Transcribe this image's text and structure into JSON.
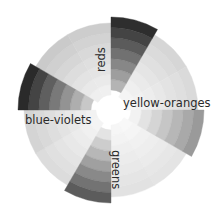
{
  "diagram": {
    "type": "color-wheel",
    "center": [
      111,
      110
    ],
    "inner_radius": 15,
    "outer_radius": 87,
    "highlight_outer_radius": 93,
    "band_count": 7,
    "segment_count": 12,
    "segment_start_angle_deg": -90,
    "segment_span_deg": 30,
    "segments": [
      {
        "index": 0,
        "highlighted": true,
        "name": "reds",
        "outer_gray": "#2e2e2e",
        "inner_gray": "#b4b4b4"
      },
      {
        "index": 1,
        "highlighted": false,
        "outer_gray": "#d6d6d6",
        "inner_gray": "#f4f4f4"
      },
      {
        "index": 2,
        "highlighted": false,
        "outer_gray": "#dadada",
        "inner_gray": "#f6f6f6"
      },
      {
        "index": 3,
        "highlighted": true,
        "name": "yellow-oranges",
        "outer_gray": "#9a9a9a",
        "inner_gray": "#f2f2f2"
      },
      {
        "index": 4,
        "highlighted": false,
        "outer_gray": "#e4e4e4",
        "inner_gray": "#f8f8f8"
      },
      {
        "index": 5,
        "highlighted": false,
        "outer_gray": "#e2e2e2",
        "inner_gray": "#f6f6f6"
      },
      {
        "index": 6,
        "highlighted": true,
        "name": "greens",
        "outer_gray": "#5c5c5c",
        "inner_gray": "#e4e4e4"
      },
      {
        "index": 7,
        "highlighted": false,
        "outer_gray": "#dcdcdc",
        "inner_gray": "#f4f4f4"
      },
      {
        "index": 8,
        "highlighted": false,
        "outer_gray": "#d4d4d4",
        "inner_gray": "#f2f2f2"
      },
      {
        "index": 9,
        "highlighted": true,
        "name": "blue-violets",
        "outer_gray": "#2a2a2a",
        "inner_gray": "#c8c8c8"
      },
      {
        "index": 10,
        "highlighted": false,
        "outer_gray": "#cacaca",
        "inner_gray": "#efefef"
      },
      {
        "index": 11,
        "highlighted": false,
        "outer_gray": "#cdcdcd",
        "inner_gray": "#f0f0f0"
      }
    ],
    "labels": [
      {
        "text": "reds",
        "x": 105,
        "y": 72,
        "rotate": -90,
        "anchor": "start"
      },
      {
        "text": "yellow-oranges",
        "x": 123,
        "y": 107,
        "rotate": 0,
        "anchor": "start"
      },
      {
        "text": "blue-violets",
        "x": 25,
        "y": 124,
        "rotate": 0,
        "anchor": "start"
      },
      {
        "text": "greens",
        "x": 112,
        "y": 150,
        "rotate": 90,
        "anchor": "start"
      }
    ]
  }
}
